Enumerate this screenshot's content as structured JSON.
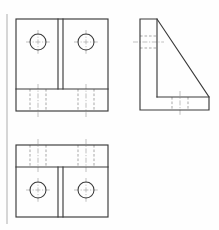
{
  "sheet": {
    "width": 219,
    "height": 230,
    "background_color": "#fefefe",
    "title": "Orthographic Multiview Drawing - Angle Bracket",
    "drawing_type": "third-angle orthographic projection",
    "line_colors": {
      "visible_edge": "#3a3a3a",
      "hidden_edge": "#9a9a9a",
      "center_line": "#a8a8a8",
      "scan_artifact": "#cccccc"
    }
  },
  "artifact": {
    "label": "scan-margin-line",
    "x": 7,
    "y1": 14,
    "y2": 224
  },
  "views": [
    {
      "id": "top-view",
      "label": "Top View",
      "position": "upper-left",
      "outline": {
        "x": 16,
        "y": 19,
        "width": 92,
        "height": 92
      },
      "base_band": {
        "label": "base-flange-band",
        "y_top": 89,
        "y_bottom": 111,
        "height": 22
      },
      "rib": {
        "label": "center-rib",
        "x_left": 58,
        "x_right": 63,
        "y_top": 19,
        "y_bottom": 89
      },
      "holes": [
        {
          "label": "hole-left",
          "cx": 38,
          "cy": 42,
          "r": 8
        },
        {
          "label": "hole-right",
          "cx": 86,
          "cy": 42,
          "r": 8
        }
      ],
      "hidden_features": [
        {
          "label": "counterbore-left",
          "x1": 30,
          "x2": 46,
          "y_top": 89,
          "y_bottom": 111
        },
        {
          "label": "counterbore-right",
          "x1": 78,
          "x2": 94,
          "y_top": 89,
          "y_bottom": 111
        }
      ]
    },
    {
      "id": "side-view",
      "label": "Right Side View",
      "position": "upper-right",
      "outline_points": "140,19 157,19 209,97 209,110 140,110",
      "vertical_leg": {
        "x_left": 140,
        "x_right": 157,
        "y_top": 19,
        "y_bottom": 97
      },
      "base_band": {
        "y_top": 97,
        "y_bottom": 110
      },
      "hidden_features": [
        {
          "label": "hole-through-web",
          "y_top": 36,
          "y_bottom": 48,
          "x1": 140,
          "x2": 157
        },
        {
          "label": "base-counterbore",
          "x1": 172,
          "x2": 188,
          "y_top": 97,
          "y_bottom": 110
        }
      ],
      "center_lines": [
        {
          "label": "hole-axis-horizontal",
          "y": 42,
          "x1": 133,
          "x2": 164
        },
        {
          "label": "base-hole-axis-vertical",
          "x": 180,
          "y1": 91,
          "y2": 116
        }
      ]
    },
    {
      "id": "bottom-view",
      "label": "Bottom View",
      "position": "lower-left",
      "outline": {
        "x": 16,
        "y": 145,
        "width": 92,
        "height": 72
      },
      "base_band": {
        "label": "base-flange-band",
        "y_top": 145,
        "y_bottom": 167,
        "height": 22
      },
      "rib": {
        "label": "center-rib",
        "x_left": 58,
        "x_right": 63,
        "y_top": 167,
        "y_bottom": 217
      },
      "holes": [
        {
          "label": "hole-left",
          "cx": 38,
          "cy": 190,
          "r": 8
        },
        {
          "label": "hole-right",
          "cx": 86,
          "cy": 190,
          "r": 8
        }
      ],
      "hidden_features": [
        {
          "label": "counterbore-left",
          "x1": 30,
          "x2": 46,
          "y_top": 145,
          "y_bottom": 167
        },
        {
          "label": "counterbore-right",
          "x1": 78,
          "x2": 94,
          "y_top": 145,
          "y_bottom": 167
        }
      ]
    }
  ]
}
